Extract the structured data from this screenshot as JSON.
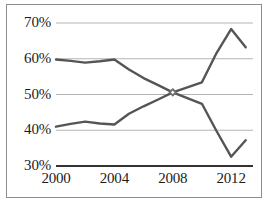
{
  "chart_data": {
    "type": "line",
    "title": "",
    "subtitle": "",
    "xlabel": "",
    "ylabel": "",
    "xlim": [
      2000,
      2013.5
    ],
    "ylim": [
      30,
      70
    ],
    "xticks": [
      "2000",
      "2004",
      "2008",
      "2012"
    ],
    "xtick_values": [
      2000,
      2004,
      2008,
      2012
    ],
    "yticks": [
      "30%",
      "40%",
      "50%",
      "60%",
      "70%"
    ],
    "ytick_values": [
      30,
      40,
      50,
      60,
      70
    ],
    "grid": true,
    "grid_color": "#b4b4b4",
    "axis_color": "#333333",
    "legend": "none",
    "x": [
      2000,
      2001,
      2002,
      2003,
      2004,
      2005,
      2006,
      2007,
      2008,
      2009,
      2010,
      2011,
      2012,
      2013
    ],
    "series": [
      {
        "name": "declining-series",
        "color": "#555555",
        "values": [
          59.8,
          59.4,
          58.9,
          59.3,
          59.8,
          57.0,
          54.6,
          52.6,
          50.6,
          49.0,
          47.4,
          39.8,
          32.6,
          37.2
        ]
      },
      {
        "name": "rising-series",
        "color": "#555555",
        "values": [
          41.0,
          41.8,
          42.4,
          41.9,
          41.6,
          44.6,
          46.7,
          48.6,
          50.6,
          52.0,
          53.4,
          61.6,
          68.3,
          63.2
        ]
      }
    ],
    "markers": [
      {
        "name": "crossover-marker",
        "x": 2008,
        "y": 50.6,
        "shape": "diamond",
        "color": "#6f6f6f"
      }
    ]
  }
}
